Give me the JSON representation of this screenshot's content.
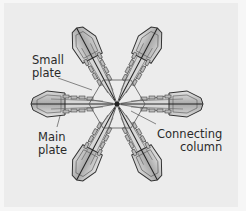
{
  "figure": {
    "colors": {
      "background": "#ececec",
      "crystal_fill": "#c9c9c9",
      "crystal_edge": "#3a3a3a",
      "leader_line": "#555555",
      "label_text": "#2a2a2a"
    }
  },
  "labels": {
    "small_plate": {
      "line1": "Small",
      "line2": "plate"
    },
    "main_plate": {
      "line1": "Main",
      "line2": "plate"
    },
    "connecting_column": {
      "line1": "Connecting",
      "line2": "column"
    }
  }
}
